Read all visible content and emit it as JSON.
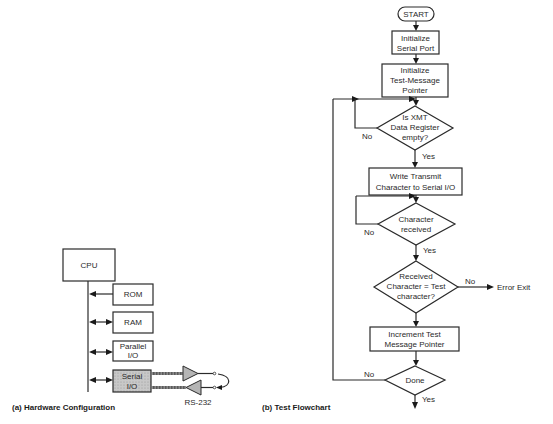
{
  "hardware": {
    "caption": "(a) Hardware Configuration",
    "cpu": "CPU",
    "rom": "ROM",
    "ram": "RAM",
    "parallel_io": [
      "Parallel",
      "I/O"
    ],
    "serial_io": [
      "Serial",
      "I/O"
    ],
    "rs232": "RS-232"
  },
  "flowchart": {
    "caption": "(b) Test Flowchart",
    "start": "START",
    "init_serial": [
      "Initialize",
      "Serial Port"
    ],
    "init_pointer": [
      "Initialize",
      "Test-Message",
      "Pointer"
    ],
    "xmt_check": [
      "Is XMT",
      "Data Register",
      "empty?"
    ],
    "write_char": [
      "Write Transmit",
      "Character to Serial I/O"
    ],
    "char_received": [
      "Character",
      "received"
    ],
    "compare": [
      "Received",
      "Character = Test",
      "character?"
    ],
    "increment": [
      "Increment Test",
      "Message Pointer"
    ],
    "done": "Done",
    "yes": "Yes",
    "no": "No",
    "error_exit": "Error Exit"
  }
}
